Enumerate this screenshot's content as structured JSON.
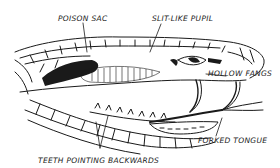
{
  "diagram": {
    "labels": {
      "poison_sac": "POISON SAC",
      "slit_pupil": "SLIT-LIKE PUPIL",
      "hollow_fangs": "HOLLOW FANGS",
      "forked_tongue": "FORKED TONGUE",
      "teeth": "TEETH POINTING BACKWARDS"
    },
    "colors": {
      "ink": "#1a1a1a",
      "background": "#ffffff"
    }
  }
}
